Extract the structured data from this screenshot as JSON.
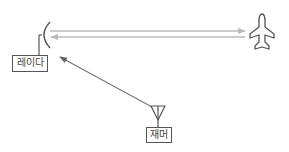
{
  "diagram": {
    "nodes": [
      {
        "id": "radar",
        "label": "레이다",
        "icon": "radar-dish-icon"
      },
      {
        "id": "aircraft",
        "label": "",
        "icon": "airplane-icon"
      },
      {
        "id": "jammer",
        "label": "재머",
        "icon": "antenna-icon"
      }
    ],
    "edges": [
      {
        "from": "radar",
        "to": "aircraft",
        "type": "transmit-signal"
      },
      {
        "from": "aircraft",
        "to": "radar",
        "type": "echo-signal"
      },
      {
        "from": "jammer",
        "to": "radar",
        "type": "jamming-signal"
      }
    ]
  },
  "labels": {
    "radar": "레이다",
    "jammer": "재머"
  },
  "colors": {
    "signal_line": "#bbbbbb",
    "jam_line": "#777777",
    "icon_stroke": "#555555"
  }
}
